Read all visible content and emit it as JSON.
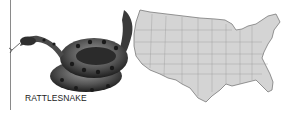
{
  "figure": {
    "caption": "RATTLESNAKE",
    "subjects": [
      "rattlesnake-illustration",
      "us-map"
    ],
    "colors": {
      "map_fill": "#d4d4d4",
      "map_stroke": "#8c8c8c",
      "snake_dark": "#2a2a2a",
      "snake_mid": "#6b6b6b",
      "rule": "#8a8a8a"
    }
  }
}
